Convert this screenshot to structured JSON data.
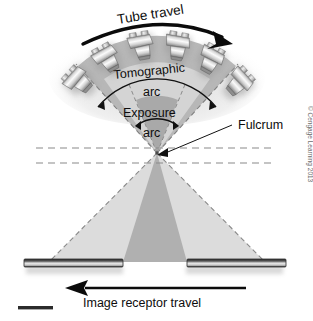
{
  "figure": {
    "title_alt": "Tomographic arc diagram",
    "labels": {
      "tube_travel": "Tube travel",
      "tomographic_arc_line1": "Tomographic",
      "tomographic_arc_line2": "arc",
      "exposure_arc_line1": "Exposure",
      "exposure_arc_line2": "arc",
      "fulcrum": "Fulcrum",
      "image_receptor_travel": "Image receptor travel"
    },
    "credit": "© Cengage Learning 2013",
    "colors": {
      "background": "#ffffff",
      "ink": "#0d0d0d",
      "outer_beam_fill": "#d9d9d9",
      "mid_beam_fill": "#bdbdbd",
      "inner_beam_fill": "#9e9e9e",
      "upper_outer_wedge": "#b5b5b5",
      "upper_mid_wedge": "#d2d2d2",
      "upper_inner_wedge": "#a8a8a8",
      "dashed_line": "#8a8a8a",
      "receptor_dark": "#3a3a3a",
      "receptor_light": "#f2f2f2",
      "tube_body_light": "#f4f4f4",
      "tube_body_dark": "#7a7a7a",
      "shadow": "#b9b9b9"
    },
    "geometry": {
      "fulcrum_x": 157,
      "fulcrum_y": 153,
      "tube_count": 6,
      "dashed_horizontal_lines": 2,
      "receptor_bars": 2
    }
  }
}
